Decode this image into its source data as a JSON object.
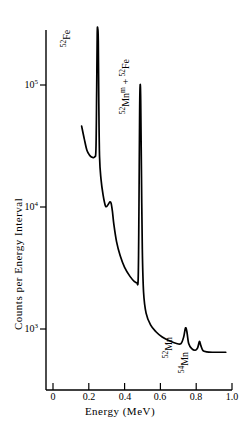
{
  "chart_data": {
    "type": "line",
    "title": "",
    "xlabel": "Energy (MeV)",
    "ylabel": "Counts per Energy Interval",
    "yscale": "log",
    "xlim": [
      0.0,
      1.0
    ],
    "ylim": [
      550,
      400000
    ],
    "grid": false,
    "legend": null,
    "xticks": [
      {
        "value": 0.0,
        "label": "0"
      },
      {
        "value": 0.2,
        "label": "0.2"
      },
      {
        "value": 0.4,
        "label": "0.4"
      },
      {
        "value": 0.6,
        "label": "0.6"
      },
      {
        "value": 0.8,
        "label": "0.8"
      },
      {
        "value": 1.0,
        "label": "1.0"
      }
    ],
    "yticks": [
      {
        "value": 1000,
        "mantissa": "10",
        "exponent": "3"
      },
      {
        "value": 10000,
        "mantissa": "10",
        "exponent": "4"
      },
      {
        "value": 100000,
        "mantissa": "10",
        "exponent": "5"
      }
    ],
    "series": [
      {
        "name": "gamma-ray spectrum",
        "color": "#000000",
        "points": [
          [
            0.16,
            46000
          ],
          [
            0.175,
            36000
          ],
          [
            0.19,
            29000
          ],
          [
            0.205,
            26500
          ],
          [
            0.22,
            25500
          ],
          [
            0.233,
            25800
          ],
          [
            0.24,
            30000
          ],
          [
            0.244,
            90000
          ],
          [
            0.247,
            260000
          ],
          [
            0.25,
            290000
          ],
          [
            0.253,
            230000
          ],
          [
            0.256,
            70000
          ],
          [
            0.26,
            26000
          ],
          [
            0.268,
            17000
          ],
          [
            0.28,
            12500
          ],
          [
            0.292,
            10300
          ],
          [
            0.3,
            10100
          ],
          [
            0.31,
            10600
          ],
          [
            0.318,
            11000
          ],
          [
            0.325,
            10700
          ],
          [
            0.332,
            9200
          ],
          [
            0.34,
            7200
          ],
          [
            0.355,
            5200
          ],
          [
            0.375,
            4000
          ],
          [
            0.4,
            3200
          ],
          [
            0.43,
            2700
          ],
          [
            0.455,
            2450
          ],
          [
            0.468,
            2400
          ],
          [
            0.476,
            2600
          ],
          [
            0.48,
            9000
          ],
          [
            0.484,
            60000
          ],
          [
            0.487,
            100000
          ],
          [
            0.49,
            75000
          ],
          [
            0.494,
            20000
          ],
          [
            0.499,
            4500
          ],
          [
            0.506,
            2000
          ],
          [
            0.52,
            1350
          ],
          [
            0.545,
            1080
          ],
          [
            0.575,
            950
          ],
          [
            0.61,
            860
          ],
          [
            0.65,
            800
          ],
          [
            0.69,
            760
          ],
          [
            0.715,
            760
          ],
          [
            0.73,
            860
          ],
          [
            0.74,
            1020
          ],
          [
            0.748,
            950
          ],
          [
            0.758,
            760
          ],
          [
            0.775,
            690
          ],
          [
            0.795,
            670
          ],
          [
            0.808,
            700
          ],
          [
            0.818,
            790
          ],
          [
            0.826,
            730
          ],
          [
            0.838,
            665
          ],
          [
            0.858,
            650
          ],
          [
            0.89,
            645
          ],
          [
            0.93,
            645
          ],
          [
            0.965,
            645
          ]
        ]
      }
    ],
    "annotations": [
      {
        "id": "fe52-peak-label",
        "text": "52Fe",
        "sup": "52",
        "base": "Fe",
        "meta": "",
        "x": 0.25,
        "y": 290000,
        "rotation": -90
      },
      {
        "id": "mn52m-fe52-peak-label",
        "text": "52Mnm + 52Fe",
        "sup": "52",
        "base": "Mn",
        "meta": "m",
        "base2": " + ",
        "sup2": "52",
        "base3": "Fe",
        "x": 0.487,
        "y": 100000,
        "rotation": -90
      },
      {
        "id": "mn52-peak-label",
        "text": "52Mn",
        "sup": "52",
        "base": "Mn",
        "meta": "",
        "x": 0.74,
        "y": 1020,
        "rotation": -90
      },
      {
        "id": "mn54-peak-label",
        "text": "54Mn",
        "sup": "54",
        "base": "Mn",
        "meta": "",
        "x": 0.818,
        "y": 790,
        "rotation": -90
      }
    ]
  },
  "axes": {
    "x_title": "Energy (MeV)",
    "y_title": "Counts per Energy Interval",
    "x_tick_labels": [
      "0",
      "0.2",
      "0.4",
      "0.6",
      "0.8",
      "1.0"
    ],
    "y_tick_mantissa": "10",
    "y_tick_exponents": [
      "3",
      "4",
      "5"
    ],
    "axis_color": "#000000"
  },
  "labels": {
    "fe52_sup": "52",
    "fe52_base": "Fe",
    "mn52m_sup": "52",
    "mn52m_base": "Mn",
    "mn52m_meta": "m",
    "mn52m_plus": " + ",
    "mn52m_sup2": "52",
    "mn52m_base2": "Fe",
    "mn52_sup": "52",
    "mn52_base": "Mn",
    "mn54_sup": "54",
    "mn54_base": "Mn"
  }
}
